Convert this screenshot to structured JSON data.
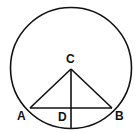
{
  "diagram": {
    "labels": {
      "A": "A",
      "B": "B",
      "C": "C",
      "D": "D"
    },
    "stroke_color": "#111111"
  }
}
